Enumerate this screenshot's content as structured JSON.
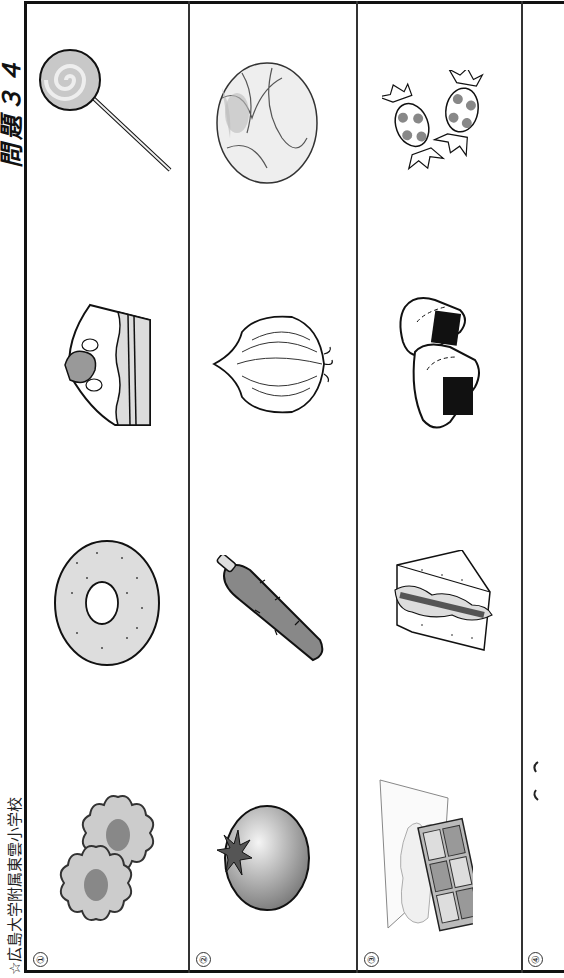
{
  "header": {
    "school_name": "☆広島大学附属東雲小学校",
    "question_title": "問題３４"
  },
  "rows": [
    {
      "number": "①",
      "items": [
        {
          "name": "cookies",
          "label": "クッキー"
        },
        {
          "name": "donut",
          "label": "ドーナツ"
        },
        {
          "name": "cake",
          "label": "ケーキ"
        },
        {
          "name": "lollipop",
          "label": "キャンディ"
        }
      ]
    },
    {
      "number": "②",
      "items": [
        {
          "name": "tomato",
          "label": "トマト"
        },
        {
          "name": "carrot",
          "label": "にんじん"
        },
        {
          "name": "onion",
          "label": "たまねぎ"
        },
        {
          "name": "cabbage",
          "label": "キャベツ"
        }
      ]
    },
    {
      "number": "③",
      "items": [
        {
          "name": "chocolate",
          "label": "チョコレート"
        },
        {
          "name": "sandwich",
          "label": "サンドイッチ"
        },
        {
          "name": "onigiri",
          "label": "おにぎり"
        },
        {
          "name": "candies",
          "label": "あめ"
        }
      ]
    },
    {
      "number": "④",
      "items": []
    }
  ],
  "colors": {
    "line": "#111111",
    "fill_light": "#d8d8d8",
    "fill_mid": "#a8a8a8",
    "fill_dark": "#777777"
  }
}
